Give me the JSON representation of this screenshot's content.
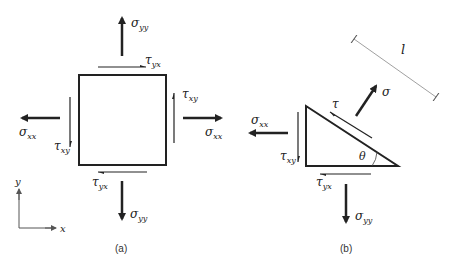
{
  "colors": {
    "ink": "#222222",
    "thin": "#555555",
    "dim": "#888888",
    "background": "#ffffff"
  },
  "panel_a": {
    "caption": "(a)",
    "labels": {
      "sigma_yy_top": {
        "sym": "σ",
        "sub": "yy"
      },
      "sigma_yy_bottom": {
        "sym": "σ",
        "sub": "yy"
      },
      "sigma_xx_left": {
        "sym": "σ",
        "sub": "xx"
      },
      "sigma_xx_right": {
        "sym": "σ",
        "sub": "xx"
      },
      "tau_yx_top": {
        "sym": "τ",
        "sub": "yx"
      },
      "tau_yx_bottom": {
        "sym": "τ",
        "sub": "yx"
      },
      "tau_xy_left": {
        "sym": "τ",
        "sub": "xy"
      },
      "tau_xy_right": {
        "sym": "τ",
        "sub": "xy"
      }
    },
    "axes": {
      "x_label": "x",
      "y_label": "y"
    }
  },
  "panel_b": {
    "caption": "(b)",
    "labels": {
      "sigma": {
        "sym": "σ"
      },
      "tau": {
        "sym": "τ"
      },
      "sigma_xx": {
        "sym": "σ",
        "sub": "xx"
      },
      "tau_xy": {
        "sym": "τ",
        "sub": "xy"
      },
      "tau_yx": {
        "sym": "τ",
        "sub": "yx"
      },
      "sigma_yy": {
        "sym": "σ",
        "sub": "yy"
      },
      "theta": "θ",
      "length": "l"
    }
  }
}
